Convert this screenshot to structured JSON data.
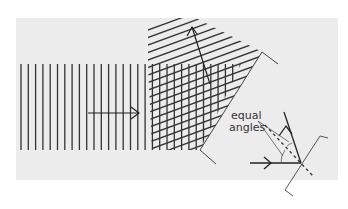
{
  "figure": {
    "background_color": "#ececec",
    "line_color": "#333333",
    "labels": {
      "equal_angles_line1": "equal",
      "equal_angles_line2": "angles"
    },
    "elements": [
      {
        "name": "incident-wavefronts",
        "type": "parallel vertical lines"
      },
      {
        "name": "reflected-wavefronts",
        "type": "parallel tilted lines"
      },
      {
        "name": "interference-crosshatch",
        "type": "overlap region near mirror"
      },
      {
        "name": "mirror",
        "type": "diagonal line with bracket ends"
      },
      {
        "name": "incident-arrow",
        "direction": "right"
      },
      {
        "name": "reflected-arrow",
        "direction": "up-left"
      },
      {
        "name": "inset-reflection-diagram",
        "parts": [
          "small mirror",
          "incident ray",
          "reflected ray",
          "dashed normal",
          "angle arcs"
        ]
      }
    ]
  }
}
